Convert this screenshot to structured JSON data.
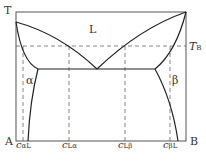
{
  "diagram": {
    "type": "binary eutectic phase diagram",
    "axis": {
      "y_label": "T",
      "left_component": "A",
      "right_component": "B"
    },
    "regions": {
      "liquid": "L",
      "alpha": "α",
      "beta": "β"
    },
    "temperature_line": {
      "label_main": "T",
      "label_sub": "B"
    },
    "compositions": [
      {
        "main": "c",
        "sub": "αL"
      },
      {
        "main": "c",
        "sub": "Lα"
      },
      {
        "main": "c",
        "sub": "Lβ"
      },
      {
        "main": "c",
        "sub": "βL"
      }
    ]
  }
}
